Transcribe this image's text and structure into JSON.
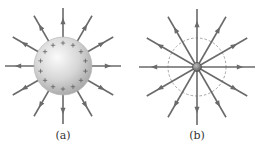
{
  "figure": {
    "panels": [
      {
        "id": "a",
        "caption": "(a)",
        "description": "Positively charged conducting sphere with radial electric field lines pointing outward",
        "charge_symbol": "+",
        "charge_count": 14,
        "field_lines": 12,
        "center": [
          63,
          66
        ],
        "radius": 29
      },
      {
        "id": "b",
        "caption": "(b)",
        "description": "Point charge with radial field lines pointing outward and dashed circle indicating sphere radius",
        "field_lines": 12,
        "center": [
          197,
          67
        ],
        "dashed_radius": 29
      }
    ],
    "colors": {
      "line": "#6a6a6a",
      "sphere_light": "#f4f4f4",
      "sphere_dark": "#a8a8a8",
      "dashed": "#999999"
    }
  }
}
